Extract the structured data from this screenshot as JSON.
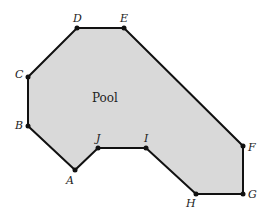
{
  "diagram": {
    "region_label": "Pool",
    "fill_color": "#d9d9d9",
    "stroke_color": "#111111",
    "vertices": [
      {
        "name": "A",
        "x": 75,
        "y": 170,
        "lx": 66,
        "ly": 184
      },
      {
        "name": "B",
        "x": 28,
        "y": 126,
        "lx": 15,
        "ly": 129
      },
      {
        "name": "C",
        "x": 28,
        "y": 77,
        "lx": 15,
        "ly": 78
      },
      {
        "name": "D",
        "x": 77,
        "y": 28,
        "lx": 73,
        "ly": 22
      },
      {
        "name": "E",
        "x": 124,
        "y": 28,
        "lx": 120,
        "ly": 22
      },
      {
        "name": "F",
        "x": 243,
        "y": 146,
        "lx": 248,
        "ly": 151
      },
      {
        "name": "G",
        "x": 243,
        "y": 194,
        "lx": 248,
        "ly": 198
      },
      {
        "name": "H",
        "x": 196,
        "y": 194,
        "lx": 186,
        "ly": 207
      },
      {
        "name": "I",
        "x": 146,
        "y": 148,
        "lx": 144,
        "ly": 142
      },
      {
        "name": "J",
        "x": 98,
        "y": 148,
        "lx": 96,
        "ly": 142
      }
    ]
  }
}
